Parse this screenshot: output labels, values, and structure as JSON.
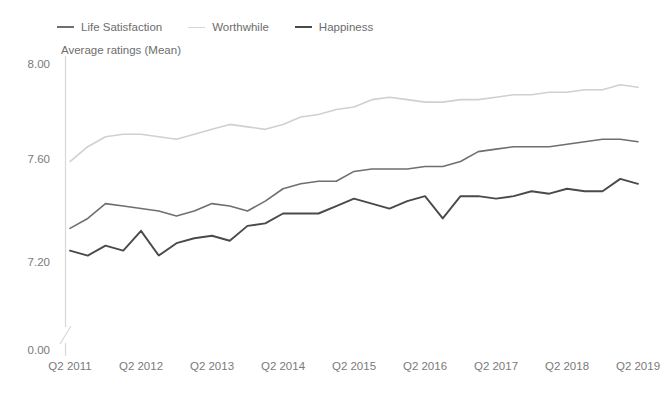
{
  "chart_data": {
    "type": "line",
    "title": "",
    "subtitle": "",
    "axis_title": "Average ratings (Mean)",
    "xlabel": "",
    "ylabel": "Average ratings (Mean)",
    "ylim": [
      7.0,
      8.0
    ],
    "ytick_labels": [
      "8.00",
      "7.60",
      "7.20",
      "0.00"
    ],
    "ytick_values": [
      8.0,
      7.6,
      7.2,
      0.0
    ],
    "axis_break": true,
    "grid": false,
    "legend_position": "top-left",
    "xtick_labels": [
      "Q2 2011",
      "Q2 2012",
      "Q2 2013",
      "Q2 2014",
      "Q2 2015",
      "Q2 2016",
      "Q2 2017",
      "Q2 2018",
      "Q2 2019"
    ],
    "x": [
      "Q2 2011",
      "Q3 2011",
      "Q4 2011",
      "Q1 2012",
      "Q2 2012",
      "Q3 2012",
      "Q4 2012",
      "Q1 2013",
      "Q2 2013",
      "Q3 2013",
      "Q4 2013",
      "Q1 2014",
      "Q2 2014",
      "Q3 2014",
      "Q4 2014",
      "Q1 2015",
      "Q2 2015",
      "Q3 2015",
      "Q4 2015",
      "Q1 2016",
      "Q2 2016",
      "Q3 2016",
      "Q4 2016",
      "Q1 2017",
      "Q2 2017",
      "Q3 2017",
      "Q4 2017",
      "Q1 2018",
      "Q2 2018",
      "Q3 2018",
      "Q4 2018",
      "Q1 2019",
      "Q2 2019"
    ],
    "series": [
      {
        "name": "Worthwhile",
        "color": "#d0d0d0",
        "width": 1.6,
        "values": [
          7.61,
          7.67,
          7.71,
          7.72,
          7.72,
          7.71,
          7.7,
          7.72,
          7.74,
          7.76,
          7.75,
          7.74,
          7.76,
          7.79,
          7.8,
          7.82,
          7.83,
          7.86,
          7.87,
          7.86,
          7.85,
          7.85,
          7.86,
          7.86,
          7.87,
          7.88,
          7.88,
          7.89,
          7.89,
          7.9,
          7.9,
          7.92,
          7.91
        ]
      },
      {
        "name": "Life Satisfaction",
        "color": "#6f6f6f",
        "width": 1.6,
        "values": [
          7.34,
          7.38,
          7.44,
          7.43,
          7.42,
          7.41,
          7.39,
          7.41,
          7.44,
          7.43,
          7.41,
          7.45,
          7.5,
          7.52,
          7.53,
          7.53,
          7.57,
          7.58,
          7.58,
          7.58,
          7.59,
          7.59,
          7.61,
          7.65,
          7.66,
          7.67,
          7.67,
          7.67,
          7.68,
          7.69,
          7.7,
          7.7,
          7.69
        ]
      },
      {
        "name": "Happiness",
        "color": "#4a4a4a",
        "width": 1.9,
        "values": [
          7.25,
          7.23,
          7.27,
          7.25,
          7.33,
          7.23,
          7.28,
          7.3,
          7.31,
          7.29,
          7.35,
          7.36,
          7.4,
          7.4,
          7.4,
          7.43,
          7.46,
          7.44,
          7.42,
          7.45,
          7.47,
          7.38,
          7.47,
          7.47,
          7.46,
          7.47,
          7.49,
          7.48,
          7.5,
          7.49,
          7.49,
          7.54,
          7.52
        ]
      }
    ]
  },
  "legend": {
    "items": [
      {
        "label": "Life Satisfaction",
        "color": "#6f6f6f",
        "width": 2
      },
      {
        "label": "Worthwhile",
        "color": "#d6d6d6",
        "width": 1.5
      },
      {
        "label": "Happiness",
        "color": "#4a4a4a",
        "width": 2.6
      }
    ]
  },
  "axis": {
    "title": "Average ratings (Mean)",
    "line_color": "#d8d8d8",
    "label_color": "#7a7a7a"
  }
}
